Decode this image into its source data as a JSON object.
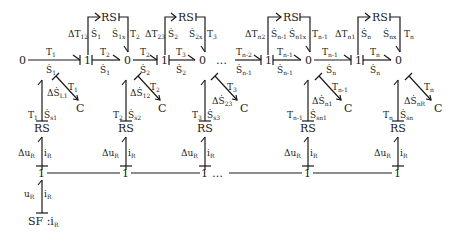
{
  "diagram": {
    "type": "bond-graph",
    "top_row": {
      "nodes": [
        "0",
        "1",
        "0",
        "1",
        "0",
        "…",
        "1",
        "0",
        "1",
        "0"
      ],
      "bonds": [
        {
          "effort": "T1",
          "flow": "Ṡ1"
        },
        {
          "effort": "T2",
          "flow": "Ṡ1"
        },
        {
          "effort": "T2",
          "flow": "Ṡ2"
        },
        {
          "effort": "T3",
          "flow": "Ṡ2"
        },
        {
          "effort": "Tn-2",
          "flow": "Ṡn-1"
        },
        {
          "effort": "Tn-1",
          "flow": "Ṡn-1"
        },
        {
          "effort": "Tn-1",
          "flow": "Ṡn"
        },
        {
          "effort": "Tn",
          "flow": "Ṡn"
        }
      ]
    },
    "rs_top": [
      {
        "label": "RS",
        "left": "ΔT12",
        "left_flow": "Ṡ1",
        "right_flow": "Ṡ1x",
        "right": "T2"
      },
      {
        "label": "RS",
        "left": "ΔT23",
        "left_flow": "Ṡ2",
        "right_flow": "Ṡ2x",
        "right": "T3"
      },
      {
        "label": "RS",
        "left": "ΔTn2",
        "left_flow": "Ṡn-1",
        "right_flow": "Ṡn1x",
        "right": "Tn-1"
      },
      {
        "label": "RS",
        "left": "ΔTn1",
        "left_flow": "Ṡn",
        "right_flow": "Ṡnx",
        "right": "Tn"
      }
    ],
    "capacitors": [
      {
        "label": "C",
        "effort": "T1",
        "flow": "ΔṠL1"
      },
      {
        "label": "C",
        "effort": "T2",
        "flow": "ΔṠ12"
      },
      {
        "label": "C",
        "effort": "T3",
        "flow": "ΔṠ23"
      },
      {
        "label": "C",
        "effort": "Tn-1",
        "flow": "ΔṠn1"
      },
      {
        "label": "C",
        "effort": "Tn",
        "flow": "ΔṠnR"
      }
    ],
    "rs_bottom": [
      {
        "label": "RS",
        "effort": "T1",
        "flow": "Ṡs1",
        "elec_effort": "ΔuR",
        "elec_flow": "iR"
      },
      {
        "label": "RS",
        "effort": "T2",
        "flow": "Ṡs2",
        "elec_effort": "ΔuR",
        "elec_flow": "iR"
      },
      {
        "label": "RS",
        "effort": "T3",
        "flow": "Ṡs3",
        "elec_effort": "ΔuR",
        "elec_flow": "iR"
      },
      {
        "label": "RS",
        "effort": "Tn-1",
        "flow": "Ṡsn1",
        "elec_effort": "ΔuR",
        "elec_flow": "iR"
      },
      {
        "label": "RS",
        "effort": "Tn",
        "flow": "Ṡsn",
        "elec_effort": "ΔuR",
        "elec_flow": "iR"
      }
    ],
    "bottom_row": {
      "nodes": [
        "1",
        "1",
        "1",
        "…",
        "1",
        "1"
      ]
    },
    "source": {
      "label": "SF : iR",
      "effort": "uR",
      "flow": "iR"
    }
  }
}
